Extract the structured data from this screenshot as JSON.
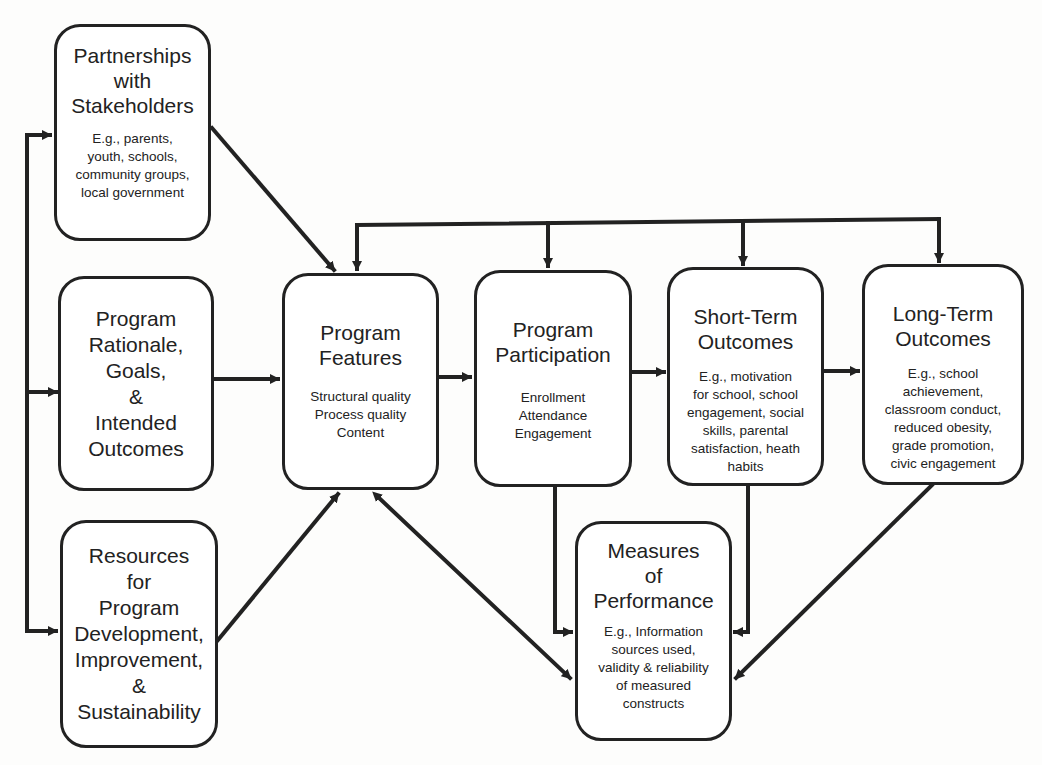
{
  "diagram": {
    "type": "logic-model flowchart",
    "boxes": {
      "partnerships": {
        "title": "Partnerships\nwith\nStakeholders",
        "detail": "E.g., parents,\nyouth, schools,\ncommunity groups,\nlocal government"
      },
      "rationale": {
        "title": "Program\nRationale,\nGoals,\n&\nIntended\nOutcomes"
      },
      "resources": {
        "title": "Resources\nfor\nProgram\nDevelopment,\nImprovement,\n&\nSustainability"
      },
      "features": {
        "title": "Program\nFeatures",
        "detail": "Structural quality\nProcess quality\nContent"
      },
      "participation": {
        "title": "Program\nParticipation",
        "detail": "Enrollment\nAttendance\nEngagement"
      },
      "short_term": {
        "title": "Short-Term\nOutcomes",
        "detail": "E.g., motivation\nfor school, school\nengagement, social\nskills, parental\nsatisfaction, heath\nhabits"
      },
      "long_term": {
        "title": "Long-Term\nOutcomes",
        "detail": "E.g., school\nachievement,\nclassroom conduct,\nreduced obesity,\ngrade promotion,\ncivic engagement"
      },
      "measures": {
        "title": "Measures\nof\nPerformance",
        "detail": "E.g., Information\nsources used,\nvalidity & reliability\nof measured\nconstructs"
      }
    },
    "edges": [
      {
        "from": "left-bus",
        "to": "partnerships",
        "type": "arrow"
      },
      {
        "from": "left-bus",
        "to": "rationale",
        "type": "arrow"
      },
      {
        "from": "left-bus",
        "to": "resources",
        "type": "arrow"
      },
      {
        "from": "partnerships",
        "to": "features",
        "type": "arrow"
      },
      {
        "from": "rationale",
        "to": "features",
        "type": "arrow"
      },
      {
        "from": "resources",
        "to": "features",
        "type": "arrow"
      },
      {
        "from": "features",
        "to": "participation",
        "type": "arrow"
      },
      {
        "from": "participation",
        "to": "short_term",
        "type": "arrow"
      },
      {
        "from": "short_term",
        "to": "long_term",
        "type": "arrow"
      },
      {
        "from": "top-bus",
        "to": "features",
        "type": "arrow"
      },
      {
        "from": "top-bus",
        "to": "participation",
        "type": "arrow"
      },
      {
        "from": "top-bus",
        "to": "short_term",
        "type": "arrow"
      },
      {
        "from": "top-bus",
        "to": "long_term",
        "type": "arrow"
      },
      {
        "from": "participation",
        "to": "measures",
        "type": "arrow"
      },
      {
        "from": "short_term",
        "to": "measures",
        "type": "arrow"
      },
      {
        "from": "long_term",
        "to": "measures",
        "type": "arrow"
      },
      {
        "from": "features",
        "to": "measures",
        "type": "bidirectional"
      }
    ],
    "colors": {
      "stroke": "#222222",
      "background": "#ffffff"
    }
  }
}
